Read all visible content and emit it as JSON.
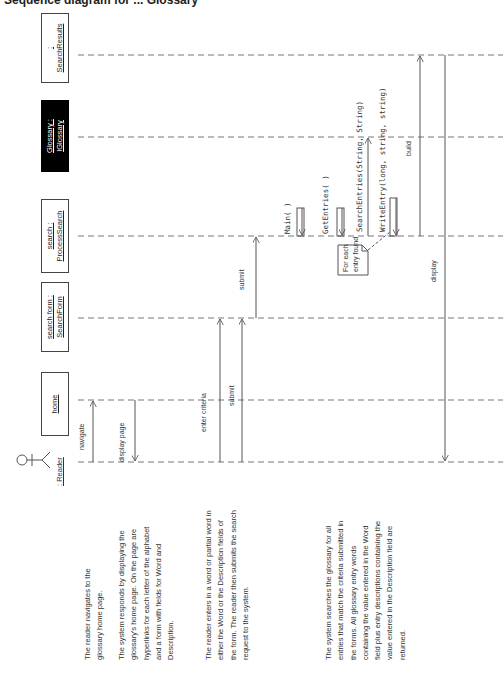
{
  "title": "Sequence diagram for ... Glossary",
  "participants": [
    {
      "id": "reader",
      "line1": ": Reader",
      "line2": "",
      "kind": "actor"
    },
    {
      "id": "home",
      "line1": "home",
      "line2": "",
      "kind": "boundary"
    },
    {
      "id": "searchform",
      "line1": "search form :",
      "line2": "SearchForm",
      "kind": "object"
    },
    {
      "id": "search",
      "line1": "search :",
      "line2": "ProcessSearch",
      "kind": "object"
    },
    {
      "id": "glossary",
      "line1": "Glossary :",
      "line2": "IGlossary",
      "kind": "interface"
    },
    {
      "id": "searchresults",
      "line1": ":",
      "line2": "SearchResults",
      "kind": "object"
    }
  ],
  "messages": [
    {
      "label": "navigate",
      "from": "reader",
      "to": "home"
    },
    {
      "label": "display page",
      "from": "home",
      "to": "reader"
    },
    {
      "label": "enter criteria",
      "from": "reader",
      "to": "searchform"
    },
    {
      "label": "submit",
      "from": "reader",
      "to": "searchform"
    },
    {
      "label": "submit",
      "from": "searchform",
      "to": "search"
    },
    {
      "label": "Main( )",
      "from": "search",
      "to": "search"
    },
    {
      "label": "GetEntries( )",
      "from": "search",
      "to": "search"
    },
    {
      "label": "SearchEntries(String, String)",
      "from": "search",
      "to": "glossary"
    },
    {
      "label": "WriteEntry(long, string, string)",
      "from": "search",
      "to": "search"
    },
    {
      "label": "build",
      "from": "search",
      "to": "searchresults"
    },
    {
      "label": "display",
      "from": "searchresults",
      "to": "reader"
    }
  ],
  "note": {
    "line1": "For each",
    "line2": "entry found"
  },
  "descriptions": [
    "The reader navigates to the glossary home page.",
    "The system responds by displaying the glossary's home page. On the page are hyperlinks for each letter of the alphabet and a form with fields for Word and Description.",
    "The reader enters in a word or partial word in either the Word or the Description fields of the form. The reader then submits the search request to the system.",
    "The system searches the glossary for all entries that match the criteria submitted in the forms. All glossary entry words containing the value entered in the Word field plus entry descriptions containing the value entered in the Description field are returned."
  ],
  "colors": {
    "line": "#555555",
    "interface_fill": "#000000",
    "background": "#ffffff"
  }
}
